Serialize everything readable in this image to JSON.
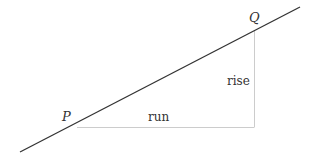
{
  "diagram": {
    "points": {
      "P": {
        "label": "P",
        "x": 77,
        "y": 127
      },
      "Q": {
        "label": "Q",
        "x": 254,
        "y": 30
      }
    },
    "line": {
      "x1": 20,
      "y1": 152,
      "x2": 300,
      "y2": 7,
      "color": "#333333"
    },
    "run": {
      "label": "run",
      "x1": 77,
      "y1": 127,
      "x2": 254,
      "y2": 127,
      "color": "#cccccc"
    },
    "rise": {
      "label": "rise",
      "x1": 254,
      "y1": 30,
      "x2": 254,
      "y2": 127,
      "color": "#cccccc"
    }
  }
}
